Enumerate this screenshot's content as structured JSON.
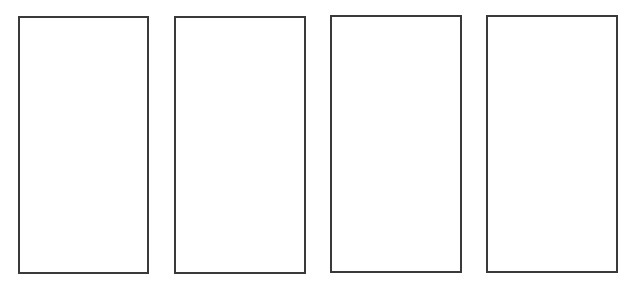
{
  "canvas": {
    "width": 632,
    "height": 288,
    "background": "#ffffff"
  },
  "style": {
    "border_color": "#3a3a3a",
    "border_width": 2
  },
  "panels": [
    {
      "x": 18,
      "y": 16,
      "w": 131,
      "h": 258
    },
    {
      "x": 174,
      "y": 16,
      "w": 132,
      "h": 258
    },
    {
      "x": 330,
      "y": 15,
      "w": 132,
      "h": 258
    },
    {
      "x": 486,
      "y": 15,
      "w": 132,
      "h": 258
    }
  ]
}
